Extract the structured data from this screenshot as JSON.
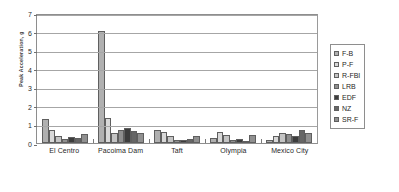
{
  "chart_data": {
    "type": "bar",
    "title": "",
    "xlabel": "",
    "ylabel": "Peak Acceleration, g",
    "ylim": [
      0,
      7
    ],
    "yticks": [
      0,
      1,
      2,
      3,
      4,
      5,
      6,
      7
    ],
    "grid": true,
    "legend_position": "right",
    "categories": [
      "El Centro",
      "Pacoima Dam",
      "Taft",
      "Olympia",
      "Mexico City"
    ],
    "series": [
      {
        "name": "F-B",
        "color": "#b0b0b0",
        "values": [
          1.3,
          6.05,
          0.72,
          0.28,
          0.18
        ]
      },
      {
        "name": "P-F",
        "color": "#d8d8d8",
        "values": [
          0.7,
          1.35,
          0.6,
          0.6,
          0.38
        ]
      },
      {
        "name": "R-FBI",
        "color": "#c4c4c4",
        "values": [
          0.4,
          0.52,
          0.36,
          0.42,
          0.52
        ]
      },
      {
        "name": "LRB",
        "color": "#8f8f8f",
        "values": [
          0.22,
          0.7,
          0.14,
          0.16,
          0.46
        ]
      },
      {
        "name": "EDF",
        "color": "#3d3d3d",
        "values": [
          0.34,
          0.82,
          0.17,
          0.22,
          0.4
        ]
      },
      {
        "name": "NZ",
        "color": "#666666",
        "values": [
          0.26,
          0.66,
          0.2,
          0.13,
          0.68
        ]
      },
      {
        "name": "SR-F",
        "color": "#909090",
        "values": [
          0.46,
          0.56,
          0.4,
          0.45,
          0.54
        ]
      }
    ]
  },
  "axis": {
    "y_title": "Peak Acceleration, g"
  }
}
